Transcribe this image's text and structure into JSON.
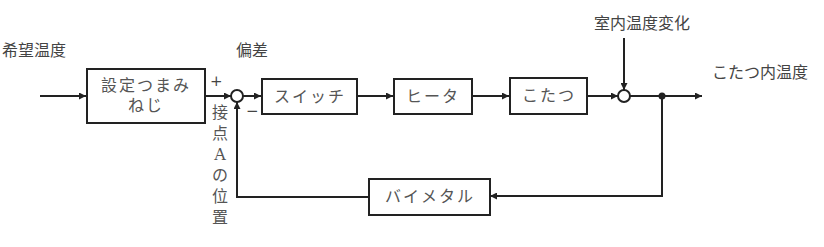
{
  "diagram": {
    "labels": {
      "input": "希望温度",
      "error": "偏差",
      "disturbance": "室内温度変化",
      "output": "こたつ内温度",
      "plus": "+",
      "minus": "−",
      "contact_position": [
        "接",
        "点",
        "A",
        "の",
        "位",
        "置"
      ]
    },
    "blocks": {
      "setting_knob": "設定つまみ\nねじ",
      "setting_knob_line1": "設定つまみ",
      "setting_knob_line2": "ねじ",
      "switch": "スイッチ",
      "heater": "ヒータ",
      "kotatsu": "こたつ",
      "bimetal": "バイメタル"
    },
    "colors": {
      "line": "#222222",
      "text": "#555555",
      "background": "#ffffff"
    }
  }
}
